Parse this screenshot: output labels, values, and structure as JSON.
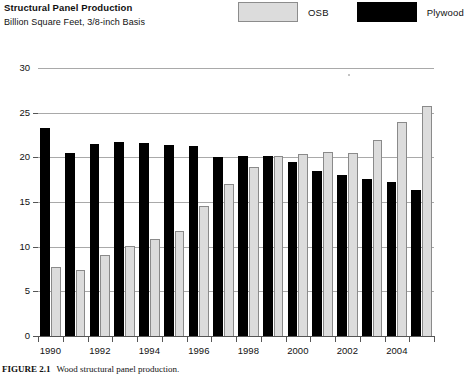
{
  "header": {
    "title": "Structural Panel Production",
    "subtitle": "Billion Square Feet, 3/8-inch Basis"
  },
  "legend": {
    "items": [
      {
        "label": "OSB",
        "color": "#dcdcdc"
      },
      {
        "label": "Plywood",
        "color": "#000000"
      }
    ]
  },
  "caption": {
    "figure": "FIGURE 2.1",
    "text": "Wood structural panel production."
  },
  "axis": {
    "y_ticks": [
      "30",
      "25",
      "20",
      "15",
      "10",
      "5",
      "0"
    ],
    "x_labels": [
      "1990",
      "1992",
      "1994",
      "1996",
      "1998",
      "2000",
      "2002",
      "2004"
    ]
  },
  "chart_data": {
    "type": "bar",
    "title": "Structural Panel Production",
    "subtitle": "Billion Square Feet, 3/8-inch Basis",
    "xlabel": "",
    "ylabel": "Billion Square Feet, 3/8-inch Basis",
    "ylim": [
      0,
      30
    ],
    "yticks": [
      0,
      5,
      10,
      15,
      20,
      25,
      30
    ],
    "grid": true,
    "legend_position": "top-right",
    "categories": [
      "1990",
      "1991",
      "1992",
      "1993",
      "1994",
      "1995",
      "1996",
      "1997",
      "1998",
      "1999",
      "2000",
      "2001",
      "2002",
      "2003",
      "2004",
      "2005"
    ],
    "series": [
      {
        "name": "Plywood",
        "color": "#000000",
        "values": [
          23.3,
          20.5,
          21.5,
          21.7,
          21.6,
          21.4,
          21.3,
          20.0,
          20.2,
          20.1,
          19.5,
          18.5,
          18.0,
          17.6,
          17.2,
          16.3
        ]
      },
      {
        "name": "OSB",
        "color": "#dcdcdc",
        "values": [
          7.7,
          7.4,
          9.1,
          10.1,
          10.9,
          11.7,
          14.6,
          17.0,
          18.9,
          20.1,
          20.4,
          20.6,
          20.5,
          21.9,
          24.0,
          25.8
        ]
      }
    ]
  }
}
